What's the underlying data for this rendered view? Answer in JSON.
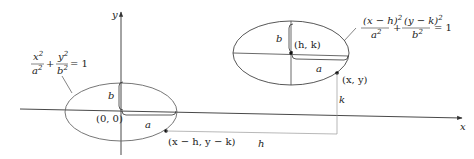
{
  "figure": {
    "axes": {
      "x_label": "x",
      "y_label": "y"
    },
    "left_ellipse": {
      "equation": {
        "n1": "x",
        "d1": "a",
        "n2": "y",
        "d2": "b",
        "exp": "2",
        "plus": "+",
        "rhs": "= 1"
      },
      "center_label": "(0, 0)",
      "semi_major_label": "a",
      "semi_minor_label": "b",
      "point_label": "(x − h, y − k)"
    },
    "right_ellipse": {
      "equation": {
        "n1": "(x − h)",
        "d1": "a",
        "n2": "(y − k)",
        "d2": "b",
        "exp": "2",
        "plus": "+",
        "rhs": "= 1"
      },
      "center_label": "(h, k)",
      "semi_major_label": "a",
      "semi_minor_label": "b",
      "point_label": "(x, y)"
    },
    "shift_labels": {
      "horizontal": "h",
      "vertical": "k"
    },
    "colors": {
      "ellipse": "#555555",
      "axis": "#333333",
      "guide": "#888888",
      "ink": "#222222"
    }
  }
}
